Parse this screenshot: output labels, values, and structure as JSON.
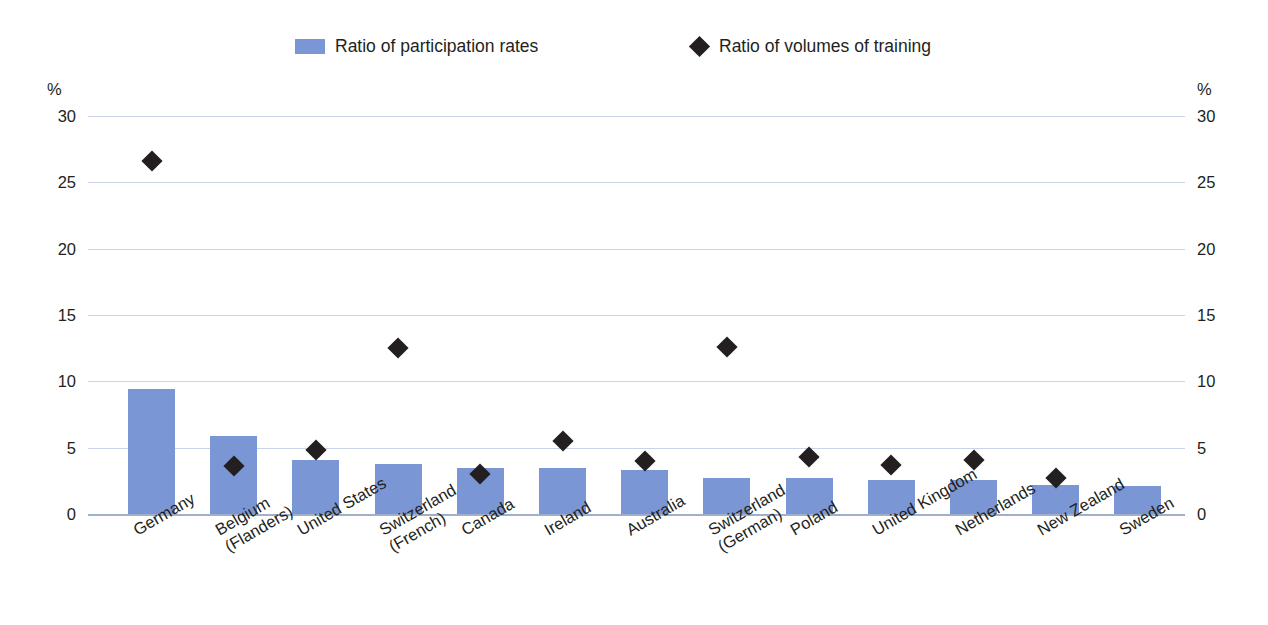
{
  "legend": {
    "bars_label": "Ratio of participation rates",
    "markers_label": "Ratio of volumes of training",
    "bar_color": "#7b96d4",
    "marker_color": "#231f20"
  },
  "axis": {
    "unit_left": "%",
    "unit_right": "%",
    "ticks": [
      "30",
      "25",
      "20",
      "15",
      "10",
      "5",
      "0"
    ]
  },
  "chart_data": {
    "type": "bar",
    "title": "",
    "subtitle": "",
    "xlabel": "",
    "ylabel": "%",
    "ylim": [
      0,
      30
    ],
    "ytick_step": 5,
    "grid": true,
    "legend_position": "top",
    "categories": [
      "Germany",
      "Belgium\n(Flanders)",
      "United States",
      "Switzerland\n(French)",
      "Canada",
      "Ireland",
      "Australia",
      "Switzerland\n(German)",
      "Poland",
      "United Kingdom",
      "Netherlands",
      "New Zealand",
      "Sweden"
    ],
    "series": [
      {
        "name": "Ratio of participation rates",
        "type": "bar",
        "color": "#7b96d4",
        "values": [
          9.4,
          5.9,
          4.1,
          3.8,
          3.5,
          3.5,
          3.3,
          2.7,
          2.7,
          2.6,
          2.6,
          2.2,
          2.1
        ]
      },
      {
        "name": "Ratio of volumes of training",
        "type": "scatter",
        "marker": "diamond",
        "color": "#231f20",
        "values": [
          26.6,
          3.6,
          4.8,
          12.5,
          3.0,
          5.5,
          4.0,
          12.6,
          4.3,
          3.7,
          4.1,
          2.7,
          null
        ]
      }
    ]
  }
}
